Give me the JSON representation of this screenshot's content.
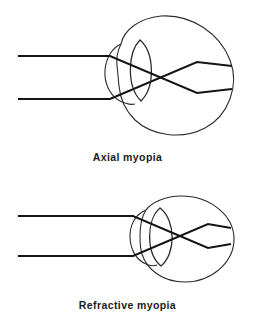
{
  "page": {
    "background_color": "#ffffff",
    "line_color": "#141414",
    "outline_color": "#2b2b2b",
    "text_color": "#1c1c1c"
  },
  "figures": [
    {
      "id": "axial-myopia",
      "caption": "Axial myopia",
      "eye_shape": "elongated",
      "ray_count": 2,
      "focus": "in front of retina"
    },
    {
      "id": "refractive-myopia",
      "caption": "Refractive myopia",
      "eye_shape": "normal-length, thick lens",
      "ray_count": 2,
      "focus": "in front of retina"
    }
  ]
}
